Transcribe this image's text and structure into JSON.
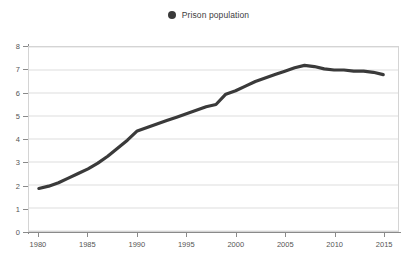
{
  "legend": {
    "position": "top-center",
    "entries": [
      {
        "label": "Prison population",
        "marker": "filled-circle",
        "color": "#3a3a3a"
      }
    ]
  },
  "colors": {
    "series_line": "#3a3a3a",
    "gridline": "#dedede",
    "axis": "#8a8a8a",
    "tick_text": "#555555",
    "plot_border": "#d4d4d4",
    "background": "#ffffff"
  },
  "chart_data": {
    "type": "line",
    "title": "",
    "subtitle": "",
    "xlabel": "",
    "ylabel": "",
    "xlim": [
      1979,
      2016.5
    ],
    "ylim": [
      0,
      8
    ],
    "grid": true,
    "legend_position": "top-center",
    "xticks": [
      1980,
      1985,
      1990,
      1995,
      2000,
      2005,
      2010,
      2015
    ],
    "xtick_labels": [
      "1980",
      "1985",
      "1990",
      "1995",
      "2000",
      "2005",
      "2010",
      "2015"
    ],
    "yticks": [
      0,
      1,
      2,
      3,
      4,
      5,
      6,
      7,
      8
    ],
    "ytick_labels": [
      "0",
      "1",
      "2",
      "3",
      "4",
      "5",
      "6",
      "7",
      "8"
    ],
    "series": [
      {
        "name": "Prison population",
        "color": "#3a3a3a",
        "x": [
          1980,
          1981,
          1982,
          1983,
          1984,
          1985,
          1986,
          1987,
          1988,
          1989,
          1990,
          1991,
          1992,
          1993,
          1994,
          1995,
          1996,
          1997,
          1998,
          1999,
          2000,
          2001,
          2002,
          2003,
          2004,
          2005,
          2006,
          2007,
          2008,
          2009,
          2010,
          2011,
          2012,
          2013,
          2014,
          2015
        ],
        "values": [
          1.85,
          1.95,
          2.1,
          2.3,
          2.5,
          2.7,
          2.95,
          3.25,
          3.6,
          3.95,
          4.35,
          4.5,
          4.65,
          4.8,
          4.95,
          5.1,
          5.25,
          5.4,
          5.5,
          5.95,
          6.1,
          6.3,
          6.5,
          6.65,
          6.8,
          6.95,
          7.1,
          7.2,
          7.15,
          7.05,
          7.0,
          7.0,
          6.95,
          6.95,
          6.9,
          6.8
        ]
      }
    ]
  }
}
